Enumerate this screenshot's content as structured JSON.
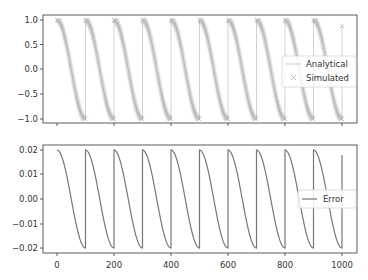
{
  "chart_data": [
    {
      "type": "line",
      "title": "",
      "xlabel": "",
      "ylabel": "",
      "xlim": [
        -49,
        1052
      ],
      "ylim": [
        -1.05,
        1.05
      ],
      "xticks": [
        0,
        200,
        400,
        600,
        800,
        1000
      ],
      "xtick_labels_visible": false,
      "yticks": [
        1.0,
        0.5,
        0.0,
        -0.5,
        -1.0
      ],
      "ytick_labels": [
        "1.0",
        "0.5",
        "0.0",
        "−0.5",
        "−1.0"
      ],
      "grid": false,
      "legend_position": "center right",
      "series": [
        {
          "name": "Analytical",
          "style": "line",
          "color": "#cccccc",
          "formula": "cos(pi * (x mod 100) / 100)",
          "x_range": [
            0,
            1000
          ],
          "period": 100,
          "min": -1.0,
          "max": 1.0
        },
        {
          "name": "Simulated",
          "style": "x-markers",
          "color": "#999999",
          "formula": "cos(pi * (x mod 100) / 100)",
          "x_range": [
            0,
            1000
          ],
          "period": 100,
          "min": -1.0,
          "max": 1.0,
          "end_value": 0.88
        }
      ]
    },
    {
      "type": "line",
      "title": "",
      "xlabel": "",
      "ylabel": "",
      "xlim": [
        -49,
        1052
      ],
      "ylim": [
        -0.021,
        0.021
      ],
      "xticks": [
        0,
        200,
        400,
        600,
        800,
        1000
      ],
      "xtick_labels": [
        "0",
        "200",
        "400",
        "600",
        "800",
        "1000"
      ],
      "yticks": [
        0.02,
        0.01,
        0.0,
        -0.01,
        -0.02
      ],
      "ytick_labels": [
        "0.02",
        "0.01",
        "0.00",
        "−0.01",
        "−0.02"
      ],
      "grid": false,
      "legend_position": "center right",
      "series": [
        {
          "name": "Error",
          "style": "line",
          "color": "#777777",
          "formula": "0.02 * cos(pi * (x mod 100) / 100)",
          "x_range": [
            0,
            1000
          ],
          "period": 100,
          "min": -0.02,
          "max": 0.02,
          "end_value": 0.018
        }
      ]
    }
  ],
  "legend_top": {
    "items": [
      {
        "label": "Analytical"
      },
      {
        "label": "Simulated"
      }
    ]
  },
  "legend_bottom": {
    "items": [
      {
        "label": "Error"
      }
    ]
  },
  "x_tick_labels": [
    "0",
    "200",
    "400",
    "600",
    "800",
    "1000"
  ],
  "top_y_tick_labels": [
    "1.0",
    "0.5",
    "0.0",
    "−0.5",
    "−1.0"
  ],
  "bottom_y_tick_labels": [
    "0.02",
    "0.01",
    "0.00",
    "−0.01",
    "−0.02"
  ]
}
